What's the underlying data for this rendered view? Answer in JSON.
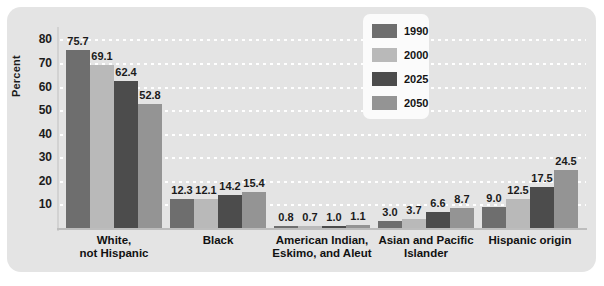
{
  "chart_data": {
    "type": "bar",
    "title": "",
    "subtitle": "",
    "xlabel": "",
    "ylabel": "Percent",
    "ylim": [
      0,
      84
    ],
    "yticks": [
      10,
      20,
      30,
      40,
      50,
      60,
      70,
      80
    ],
    "grid": true,
    "legend_position": "top-center-right",
    "categories": [
      "White,\nnot Hispanic",
      "Black",
      "American Indian,\nEskimo, and Aleut",
      "Asian and Pacific\nIslander",
      "Hispanic origin"
    ],
    "series": [
      {
        "name": "1990",
        "color": "#6e6e6e",
        "values": [
          75.7,
          12.3,
          0.8,
          3.0,
          9.0
        ]
      },
      {
        "name": "2000",
        "color": "#b9b9b9",
        "values": [
          69.1,
          12.1,
          0.7,
          3.7,
          12.5
        ]
      },
      {
        "name": "2025",
        "color": "#4c4c4c",
        "values": [
          62.4,
          14.2,
          1.0,
          6.6,
          17.5
        ]
      },
      {
        "name": "2050",
        "color": "#949494",
        "values": [
          52.8,
          15.4,
          1.1,
          8.7,
          24.5
        ]
      }
    ],
    "value_labels": [
      [
        "75.7",
        "69.1",
        "62.4",
        "52.8"
      ],
      [
        "12.3",
        "12.1",
        "14.2",
        "15.4"
      ],
      [
        "0.8",
        "0.7",
        "1.0",
        "1.1"
      ],
      [
        "3.0",
        "3.7",
        "6.6",
        "8.7"
      ],
      [
        "9.0",
        "12.5",
        "17.5",
        "24.5"
      ]
    ],
    "colors": {
      "panel_background": "#e4e4e4",
      "gridline": "#ffffff",
      "axis": "#bdbdbd",
      "text": "#1b1b1b",
      "legend_background": "#fbfbfb"
    }
  },
  "axis": {
    "ytick_labels": [
      "80",
      "70",
      "60",
      "50",
      "40",
      "30",
      "20",
      "10"
    ],
    "ytitle": "Percent"
  },
  "legend": {
    "items": [
      {
        "label": "1990"
      },
      {
        "label": "2000"
      },
      {
        "label": "2025"
      },
      {
        "label": "2050"
      }
    ]
  },
  "categories_display": [
    {
      "line1": "White,",
      "line2": "not Hispanic"
    },
    {
      "line1": "Black",
      "line2": ""
    },
    {
      "line1": "American Indian,",
      "line2": "Eskimo, and Aleut"
    },
    {
      "line1": "Asian and Pacific",
      "line2": "Islander"
    },
    {
      "line1": "Hispanic origin",
      "line2": ""
    }
  ]
}
